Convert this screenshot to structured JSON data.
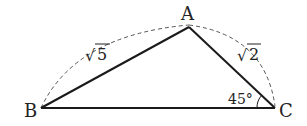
{
  "diagram": {
    "type": "triangle",
    "vertices": {
      "A": {
        "label": "A",
        "x": 189,
        "y": 27
      },
      "B": {
        "label": "B",
        "x": 41,
        "y": 108
      },
      "C": {
        "label": "C",
        "x": 275,
        "y": 108
      }
    },
    "sides": {
      "AB": {
        "label_radical": "√",
        "label_value": "5"
      },
      "AC": {
        "label_radical": "√",
        "label_value": "2"
      }
    },
    "angle_C": {
      "label": "45°"
    },
    "colors": {
      "line": "#1a1a1a",
      "dashed": "#555555",
      "text": "#222222"
    }
  }
}
